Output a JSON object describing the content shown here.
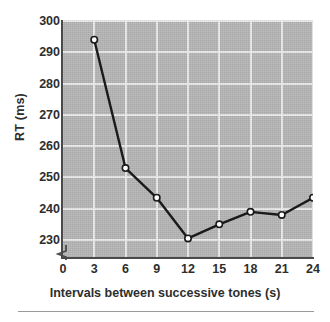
{
  "chart_data": {
    "type": "line",
    "title": "",
    "xlabel": "Intervals between successive tones (s)",
    "ylabel": "RT (ms)",
    "x": [
      3,
      6,
      9,
      12,
      15,
      18,
      21,
      24
    ],
    "values": [
      294,
      253,
      243.5,
      230.5,
      235,
      239,
      238,
      243.5
    ],
    "series": [
      {
        "name": "RT",
        "values": [
          294,
          253,
          243.5,
          230.5,
          235,
          239,
          238,
          243.5
        ]
      }
    ],
    "xlim": [
      0,
      24
    ],
    "ylim": [
      230,
      300
    ],
    "x_ticks": [
      0,
      3,
      6,
      9,
      12,
      15,
      18,
      21,
      24
    ],
    "x_tick_labels": [
      "0",
      "3",
      "6",
      "9",
      "12",
      "15",
      "18",
      "21",
      "24"
    ],
    "y_ticks": [
      230,
      240,
      250,
      260,
      270,
      280,
      290,
      300
    ],
    "y_tick_labels": [
      "230",
      "240",
      "250",
      "260",
      "270",
      "280",
      "290",
      "300"
    ],
    "grid": true,
    "grid_color": "#efefef",
    "plot_background": "#b6b6b6",
    "line_color": "#1a1a1a",
    "marker": "open-circle",
    "marker_face_color": "#ffffff",
    "marker_edge_color": "#1a1a1a",
    "legend": null,
    "axis_break": "y-axis break below 230",
    "annotations": []
  }
}
